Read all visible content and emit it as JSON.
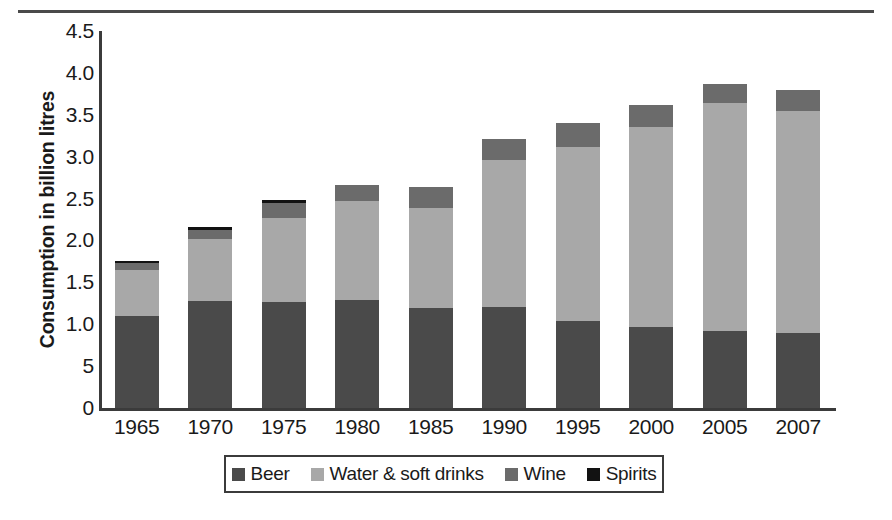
{
  "chart_data": {
    "type": "bar",
    "subtype": "stacked-column",
    "title": "",
    "xlabel": "",
    "ylabel": "Consumption in billion litres",
    "categories": [
      "1965",
      "1970",
      "1975",
      "1980",
      "1985",
      "1990",
      "1995",
      "2000",
      "2005",
      "2007"
    ],
    "ylim": [
      0,
      4.5
    ],
    "ytick_labels": [
      "4.5",
      "4.0",
      "3.5",
      "3.0",
      "2.5",
      "2.0",
      "1.5",
      "1.0",
      "5",
      "0"
    ],
    "ytick_values": [
      4.5,
      4.0,
      3.5,
      3.0,
      2.5,
      2.0,
      1.5,
      1.0,
      0.5,
      0.0
    ],
    "grid": false,
    "legend_position": "bottom",
    "series": [
      {
        "name": "Beer",
        "color": "#4a4a4a",
        "values": [
          1.1,
          1.28,
          1.27,
          1.29,
          1.19,
          1.2,
          1.04,
          0.97,
          0.92,
          0.89
        ]
      },
      {
        "name": "Water & soft drinks",
        "color": "#a8a8a8",
        "values": [
          0.55,
          0.74,
          1.0,
          1.18,
          1.2,
          1.76,
          2.07,
          2.38,
          2.72,
          2.65
        ]
      },
      {
        "name": "Wine",
        "color": "#6b6b6b",
        "values": [
          0.08,
          0.11,
          0.18,
          0.19,
          0.25,
          0.25,
          0.29,
          0.27,
          0.23,
          0.26
        ]
      },
      {
        "name": "Spirits",
        "color": "#121212",
        "values": [
          0.02,
          0.03,
          0.03,
          0.0,
          0.0,
          0.0,
          0.0,
          0.0,
          0.0,
          0.0
        ]
      }
    ],
    "totals": [
      1.75,
      2.16,
      2.48,
      2.66,
      2.64,
      3.21,
      3.4,
      3.62,
      3.87,
      3.8
    ]
  },
  "axis": {
    "y_title": "Consumption in billion litres"
  },
  "legend": {
    "items": [
      {
        "label": "Beer",
        "color": "#4a4a4a"
      },
      {
        "label": "Water & soft drinks",
        "color": "#a8a8a8"
      },
      {
        "label": "Wine",
        "color": "#6b6b6b"
      },
      {
        "label": "Spirits",
        "color": "#121212"
      }
    ]
  }
}
